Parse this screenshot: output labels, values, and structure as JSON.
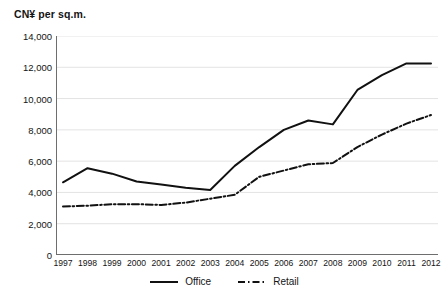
{
  "chart_data": {
    "type": "line",
    "title": "CN¥ per sq.m.",
    "xlabel": "",
    "ylabel": "CN¥ per sq.m.",
    "ylim": [
      0,
      14000
    ],
    "yticks": [
      0,
      2000,
      4000,
      6000,
      8000,
      10000,
      12000,
      14000
    ],
    "ytick_labels": [
      "0",
      "2,000",
      "4,000",
      "6,000",
      "8,000",
      "10,000",
      "12,000",
      "14,000"
    ],
    "grid": true,
    "legend_position": "bottom-center",
    "categories": [
      "1997",
      "1998",
      "1999",
      "2000",
      "2001",
      "2002",
      "2003",
      "2004",
      "2005",
      "2006",
      "2007",
      "2008",
      "2009",
      "2010",
      "2011",
      "2012"
    ],
    "series": [
      {
        "name": "Office",
        "style": "solid",
        "color": "#111111",
        "values": [
          4650,
          5550,
          5200,
          4700,
          4500,
          4300,
          4150,
          5700,
          6900,
          8000,
          8600,
          8350,
          10550,
          11500,
          12250,
          12250
        ]
      },
      {
        "name": "Retail",
        "style": "dash-dot",
        "color": "#111111",
        "values": [
          3100,
          3150,
          3250,
          3250,
          3200,
          3350,
          3600,
          3850,
          5000,
          5400,
          5800,
          5880,
          6900,
          7700,
          8400,
          8950
        ]
      }
    ]
  },
  "legend": {
    "items": [
      {
        "label": "Office",
        "style": "solid"
      },
      {
        "label": "Retail",
        "style": "dash-dot"
      }
    ]
  },
  "colors": {
    "line": "#111111",
    "grid": "#e3e3e3",
    "axis": "#6e6e6e",
    "text": "#141414",
    "background": "#ffffff"
  }
}
